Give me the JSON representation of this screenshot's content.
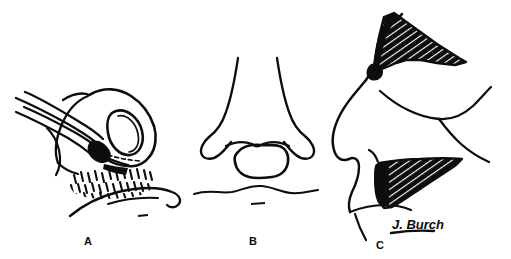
{
  "figure": {
    "background_color": "#ffffff",
    "ink_color": "#0d0d0d",
    "width": 511,
    "height": 259,
    "artist_signature": "J. Burch"
  },
  "panels": [
    {
      "id": "A",
      "label": "A",
      "caption": "Basal view of nose with instrument elevating a pocket; stippled recipient bed at the columellar base",
      "label_x": 88,
      "label_y": 245,
      "elements": {
        "instrument": "surgical-elevator",
        "shading": "stipple",
        "view": "basal-oblique"
      }
    },
    {
      "id": "B",
      "label": "B",
      "caption": "Frontal view of nose showing the stippled graft seated at the columellar base above the lip",
      "label_x": 253,
      "label_y": 245,
      "elements": {
        "shading": "stipple",
        "view": "frontal"
      }
    },
    {
      "id": "C",
      "label": "C",
      "caption": "Lateral profile showing two cross-hatched grafts: dorsal onlay and premaxillary/columellar strut",
      "label_x": 380,
      "label_y": 249,
      "elements": {
        "shading": "cross-hatch",
        "view": "lateral-profile",
        "graft_count": 2
      }
    }
  ],
  "signature": {
    "text": "J. Burch",
    "x": 392,
    "y": 229,
    "underlined": true
  }
}
